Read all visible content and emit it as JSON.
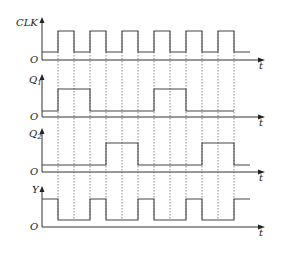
{
  "diagram": {
    "type": "timing-diagram",
    "time_axis_label": "t",
    "origin_label": "O",
    "x_axis": {
      "start": 42,
      "end": 265
    },
    "edges_x": [
      58,
      74,
      90,
      106,
      122,
      138,
      154,
      170,
      186,
      202,
      218,
      234
    ],
    "signals": [
      {
        "name": "CLK",
        "label": "CLK",
        "subscript": "",
        "axis_y": 60,
        "low_y": 52,
        "high_y": 31,
        "label_y": 23,
        "arrow_top": 17,
        "start_level": 0,
        "transitions": [
          [
            58,
            1
          ],
          [
            74,
            0
          ],
          [
            90,
            1
          ],
          [
            106,
            0
          ],
          [
            122,
            1
          ],
          [
            138,
            0
          ],
          [
            154,
            1
          ],
          [
            170,
            0
          ],
          [
            186,
            1
          ],
          [
            202,
            0
          ],
          [
            218,
            1
          ],
          [
            234,
            0
          ]
        ],
        "end_x": 250
      },
      {
        "name": "Q1",
        "label": "Q",
        "subscript": "1",
        "axis_y": 117,
        "low_y": 111,
        "high_y": 89,
        "label_y": 80,
        "arrow_top": 74,
        "start_level": 0,
        "transitions": [
          [
            58,
            1
          ],
          [
            90,
            0
          ],
          [
            154,
            1
          ],
          [
            186,
            0
          ]
        ],
        "end_x": 234
      },
      {
        "name": "Q2",
        "label": "Q",
        "subscript": "2",
        "axis_y": 172,
        "low_y": 165,
        "high_y": 143,
        "label_y": 134,
        "arrow_top": 128,
        "start_level": 0,
        "transitions": [
          [
            106,
            1
          ],
          [
            138,
            0
          ],
          [
            202,
            1
          ],
          [
            234,
            0
          ]
        ],
        "end_x": 250
      },
      {
        "name": "Y",
        "label": "Y",
        "subscript": "",
        "axis_y": 227,
        "low_y": 220,
        "high_y": 199,
        "label_y": 190,
        "arrow_top": 186,
        "start_level": 1,
        "transitions": [
          [
            58,
            0
          ],
          [
            90,
            1
          ],
          [
            106,
            0
          ],
          [
            138,
            1
          ],
          [
            154,
            0
          ],
          [
            186,
            1
          ],
          [
            202,
            0
          ],
          [
            234,
            1
          ]
        ],
        "end_x": 250
      }
    ],
    "dashed_guides": {
      "top": 31,
      "bottom": 220
    }
  }
}
